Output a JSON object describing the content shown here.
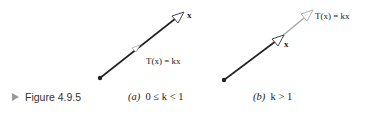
{
  "figure": {
    "label": "Figure 4.9.5",
    "marker_icon": "triangle-right-icon"
  },
  "panels": [
    {
      "id": "a",
      "caption_letter": "(a)",
      "caption_condition": "0 ≤ k < 1",
      "vector_label": "x",
      "image_label": "T(x) = kx"
    },
    {
      "id": "b",
      "caption_letter": "(b)",
      "caption_condition": "k > 1",
      "vector_label": "x",
      "image_label": "T(x) = kx"
    }
  ],
  "colors": {
    "vector": "#222222",
    "scaled_vector": "#a8a8a8",
    "marker": "#9a9a9a"
  }
}
